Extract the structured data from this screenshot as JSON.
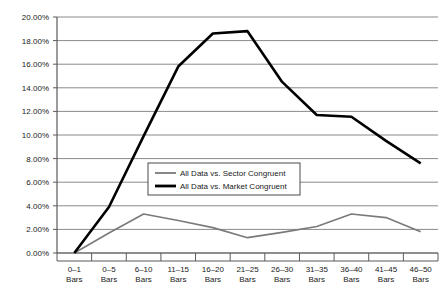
{
  "chart_data": {
    "type": "line",
    "title": "",
    "xlabel": "",
    "ylabel": "",
    "ylim": [
      0,
      0.2
    ],
    "ytick_labels": [
      "20.00%",
      "18.00%",
      "16.00%",
      "14.00%",
      "12.00%",
      "10.00%",
      "8.00%",
      "6.00%",
      "4.00%",
      "2.00%",
      "0.00%"
    ],
    "ytick_values": [
      0.2,
      0.18,
      0.16,
      0.14,
      0.12,
      0.1,
      0.08,
      0.06,
      0.04,
      0.02,
      0.0
    ],
    "grid": true,
    "legend_position": "center",
    "categories": [
      "0–1\nBars",
      "0–5\nBars",
      "6–10\nBars",
      "11–15\nBars",
      "16–20\nBars",
      "21–25\nBars",
      "26–30\nBars",
      "31–35\nBars",
      "36–40\nBars",
      "41–45\nBars",
      "46–50\nBars"
    ],
    "categories_line1": [
      "0–1",
      "0–5",
      "6–10",
      "11–15",
      "16–20",
      "21–25",
      "26–30",
      "31–35",
      "36–40",
      "41–45",
      "46–50"
    ],
    "categories_line2": [
      "Bars",
      "Bars",
      "Bars",
      "Bars",
      "Bars",
      "Bars",
      "Bars",
      "Bars",
      "Bars",
      "Bars",
      "Bars"
    ],
    "series": [
      {
        "name": "All Data vs. Sector Congruent",
        "color": "#7a7a7a",
        "values": [
          0.0,
          0.017,
          0.033,
          0.0275,
          0.0215,
          0.013,
          0.0175,
          0.0225,
          0.033,
          0.03,
          0.018
        ]
      },
      {
        "name": "All Data vs. Market Congruent",
        "color": "#000000",
        "values": [
          0.0,
          0.039,
          0.099,
          0.158,
          0.186,
          0.188,
          0.145,
          0.117,
          0.1155,
          0.095,
          0.076
        ]
      }
    ]
  },
  "legend": {
    "entries": [
      {
        "label": "All Data vs. Sector Congruent"
      },
      {
        "label": "All Data vs. Market Congruent"
      }
    ]
  }
}
